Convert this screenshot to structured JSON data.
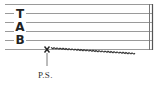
{
  "staff": {
    "clef_letters": [
      "T",
      "A",
      "B"
    ],
    "string_count": 6,
    "line_color": "#9a9a9a",
    "barline": "double"
  },
  "technique": {
    "marker": "x",
    "string": 6,
    "slide": "wavy-down",
    "label": "P.S."
  }
}
